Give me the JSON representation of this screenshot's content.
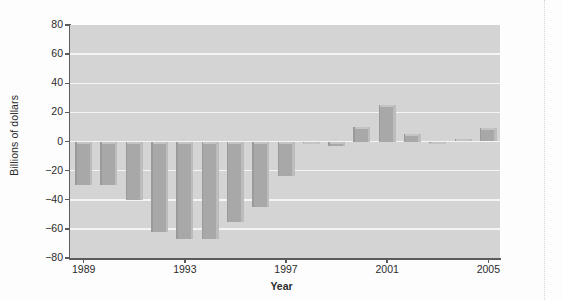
{
  "chart_data": {
    "type": "bar",
    "title": "",
    "xlabel": "Year",
    "ylabel": "Billions of dollars",
    "categories": [
      1989,
      1990,
      1991,
      1992,
      1993,
      1994,
      1995,
      1996,
      1997,
      1998,
      1999,
      2000,
      2001,
      2002,
      2003,
      2004,
      2005
    ],
    "values": [
      -30,
      -30,
      -40,
      -62,
      -67,
      -67,
      -55,
      -45,
      -24,
      -1,
      -3,
      10,
      25,
      5,
      -1,
      2,
      9
    ],
    "series": [
      {
        "name": "Federal budget surplus/deficit",
        "values": [
          -30,
          -30,
          -40,
          -62,
          -67,
          -67,
          -55,
          -45,
          -24,
          -1,
          -3,
          10,
          25,
          5,
          -1,
          2,
          9
        ]
      }
    ],
    "ylim": [
      -80,
      80
    ],
    "yticks": [
      80,
      60,
      40,
      20,
      0,
      -20,
      -40,
      -60,
      -80
    ],
    "ytick_labels": [
      "80",
      "60",
      "40",
      "20",
      "0",
      "−20",
      "−40",
      "−60",
      "−80"
    ],
    "xticks": [
      1989,
      1993,
      1997,
      2001,
      2005
    ],
    "xtick_labels": [
      "1989",
      "1993",
      "1997",
      "2001",
      "2005"
    ],
    "grid": true,
    "gridlines": "horizontal",
    "legend": false,
    "legend_position": "none",
    "bar_color": "#a8a8a8",
    "plot_background": "#d4d4d4",
    "gridline_color": "#f4f4f4",
    "axis_color": "#5b5b5b",
    "text_color": "#2b2b2b"
  },
  "artifacts": {
    "ghost_text_1": "",
    "ghost_text_2": ""
  }
}
